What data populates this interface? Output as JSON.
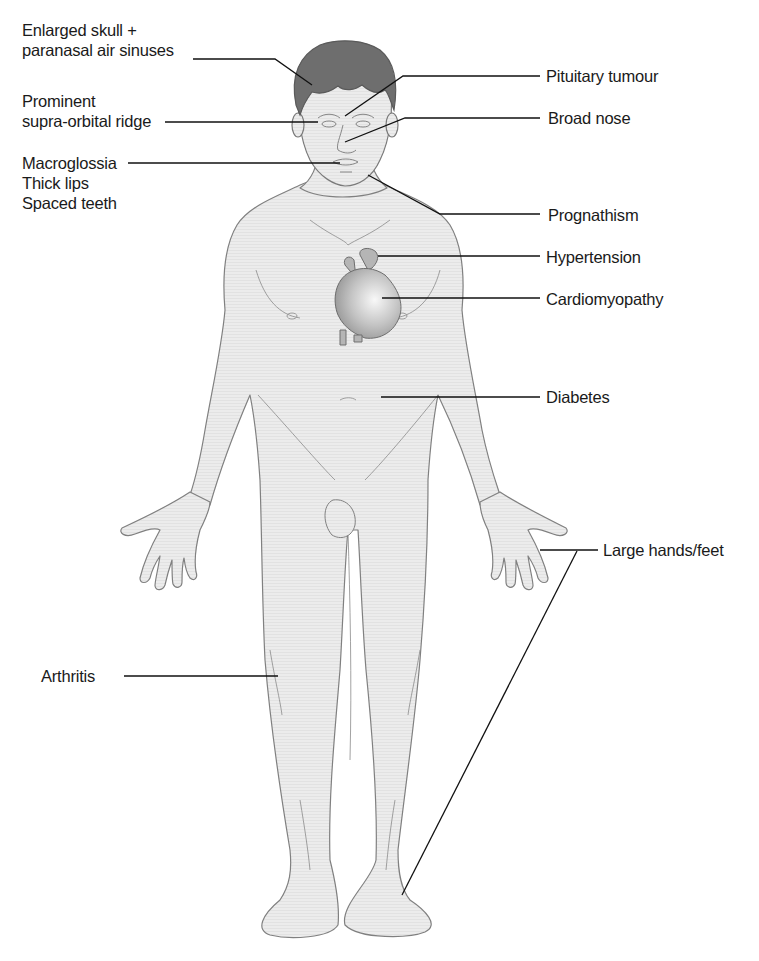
{
  "figure": {
    "colors": {
      "skin": "#e8e8e8",
      "outline": "#7a7a7a",
      "hair": "#6e6e6e",
      "heart": "#bdbdbd",
      "leader": "#111111",
      "text": "#1a1a1a"
    },
    "labels_left": [
      {
        "id": "skull",
        "lines": [
          "Enlarged skull +",
          "paranasal air sinuses"
        ]
      },
      {
        "id": "supraorbital",
        "lines": [
          "Prominent",
          "supra-orbital ridge"
        ]
      },
      {
        "id": "mouth",
        "lines": [
          "Macroglossia",
          "Thick lips",
          "Spaced teeth"
        ]
      },
      {
        "id": "arthritis",
        "lines": [
          "Arthritis"
        ]
      }
    ],
    "labels_right": [
      {
        "id": "pituitary",
        "text": "Pituitary tumour"
      },
      {
        "id": "nose",
        "text": "Broad nose"
      },
      {
        "id": "prognathism",
        "text": "Prognathism"
      },
      {
        "id": "hypertension",
        "text": "Hypertension"
      },
      {
        "id": "cardiomyopathy",
        "text": "Cardiomyopathy"
      },
      {
        "id": "diabetes",
        "text": "Diabetes"
      },
      {
        "id": "hands_feet",
        "text": "Large hands/feet"
      }
    ]
  }
}
